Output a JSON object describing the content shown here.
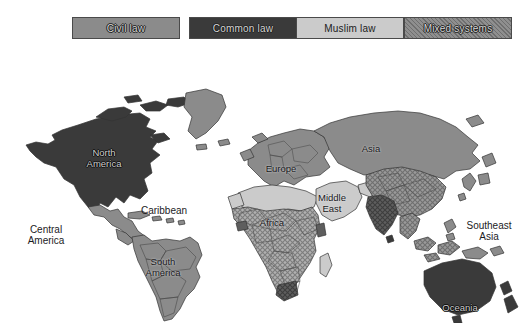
{
  "figure": {
    "kind": "world-map",
    "background_color": "#ffffff"
  },
  "legend": {
    "items": [
      {
        "id": "civil-law",
        "label": "Civil law",
        "color": "#8b8b8b",
        "pattern": "solid",
        "text_style": "light",
        "x": 72,
        "width": 108
      },
      {
        "id": "common-law",
        "label": "Common law",
        "color": "#3a3a3a",
        "pattern": "solid",
        "text_style": "light",
        "x": 189,
        "width": 108
      },
      {
        "id": "muslim-law",
        "label": "Muslim law",
        "color": "#cbcbcb",
        "pattern": "solid",
        "text_style": "dark",
        "x": 296,
        "width": 108
      },
      {
        "id": "mixed-systems",
        "label": "Mixed systems",
        "color": "#8f8f8f",
        "pattern": "crosshatch",
        "text_style": "light",
        "x": 404,
        "width": 108
      }
    ]
  },
  "map": {
    "labels": [
      {
        "id": "north-america",
        "text": "North\nAmerica",
        "x": 104,
        "y": 113,
        "style": "on-dark"
      },
      {
        "id": "caribbean",
        "text": "Caribbean",
        "x": 164,
        "y": 165,
        "style": "on-white"
      },
      {
        "id": "central-america",
        "text": "Central\nAmerica",
        "x": 46,
        "y": 190,
        "style": "on-white"
      },
      {
        "id": "south-america",
        "text": "South\nAmerica",
        "x": 163,
        "y": 222,
        "style": "on-light"
      },
      {
        "id": "europe",
        "text": "Europe",
        "x": 281,
        "y": 123,
        "style": "on-light"
      },
      {
        "id": "africa",
        "text": "Africa",
        "x": 272,
        "y": 177,
        "style": "on-light"
      },
      {
        "id": "middle-east",
        "text": "Middle\nEast",
        "x": 332,
        "y": 158,
        "style": "on-light"
      },
      {
        "id": "asia",
        "text": "Asia",
        "x": 371,
        "y": 103,
        "style": "on-light"
      },
      {
        "id": "southeast-asia",
        "text": "Southeast\nAsia",
        "x": 489,
        "y": 186,
        "style": "on-white"
      },
      {
        "id": "oceania",
        "text": "Oceania",
        "x": 460,
        "y": 262,
        "style": "on-dark"
      }
    ],
    "regions": [
      {
        "id": "canada-usa",
        "name": "North America (USA & Canada)",
        "category": "common-law"
      },
      {
        "id": "greenland",
        "name": "Greenland",
        "category": "civil-law"
      },
      {
        "id": "mexico",
        "name": "Mexico",
        "category": "civil-law"
      },
      {
        "id": "central-america-r",
        "name": "Central America",
        "category": "civil-law"
      },
      {
        "id": "caribbean-r",
        "name": "Caribbean islands",
        "category": "civil-law"
      },
      {
        "id": "south-america-r",
        "name": "South America",
        "category": "civil-law"
      },
      {
        "id": "europe-r",
        "name": "Europe",
        "category": "civil-law"
      },
      {
        "id": "russia-asia",
        "name": "Russia / Northern Asia",
        "category": "civil-law"
      },
      {
        "id": "north-africa",
        "name": "North Africa",
        "category": "muslim-law"
      },
      {
        "id": "sub-saharan",
        "name": "Sub-Saharan Africa",
        "category": "mixed-systems"
      },
      {
        "id": "middle-east-r",
        "name": "Middle East",
        "category": "muslim-law"
      },
      {
        "id": "china-r",
        "name": "China & Central Asia",
        "category": "mixed-systems"
      },
      {
        "id": "india-r",
        "name": "India subcontinent",
        "category": "common-law"
      },
      {
        "id": "southeast-asia-r",
        "name": "Southeast Asia",
        "category": "mixed-systems"
      },
      {
        "id": "oceania-r",
        "name": "Oceania (Australia & NZ)",
        "category": "common-law"
      }
    ]
  }
}
